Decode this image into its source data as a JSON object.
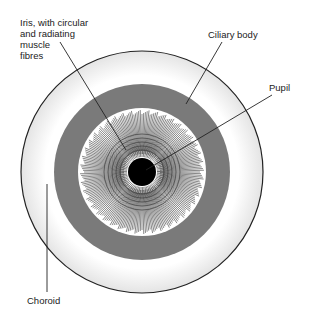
{
  "diagram": {
    "labels": {
      "iris_line1": "Iris, with circular",
      "iris_line2": "and radiating",
      "iris_line3": "muscle",
      "iris_line4": "fibres",
      "ciliary": "Ciliary body",
      "pupil": "Pupil",
      "choroid": "Choroid"
    },
    "colors": {
      "ciliary_ring": "#7a7a7a",
      "pupil": "#000000",
      "outline": "#222222"
    }
  }
}
